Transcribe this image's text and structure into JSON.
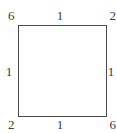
{
  "diagram": {
    "type": "labeled-square",
    "shape_name": "square",
    "stroke_color": "#4a4a4a",
    "fill_color": "#ffffff",
    "background_color": "#ffffff",
    "text_color": "#3c3c3c",
    "corners": {
      "top_left": "6",
      "top_right": "2",
      "bottom_left": "2",
      "bottom_right": "6"
    },
    "edges": {
      "top": "1",
      "right": "1",
      "bottom": "1",
      "left": "1"
    }
  }
}
